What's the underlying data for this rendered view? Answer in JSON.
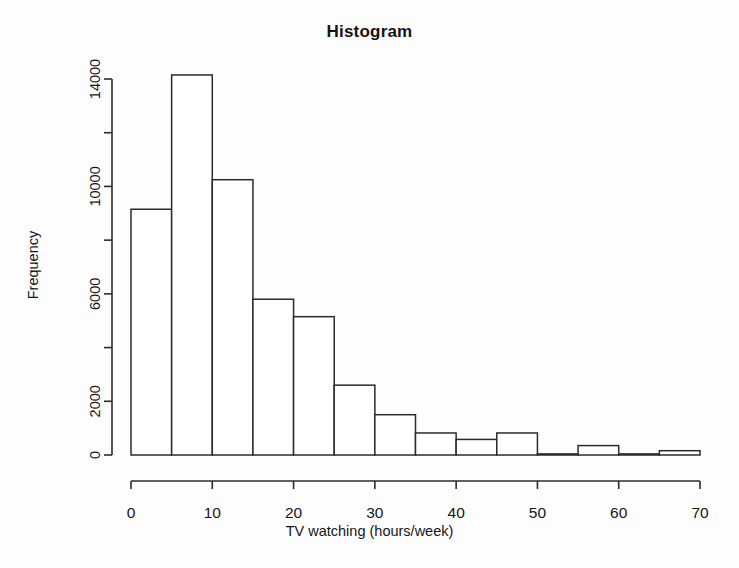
{
  "chart_data": {
    "type": "bar",
    "title": "Histogram",
    "xlabel": "TV watching (hours/week)",
    "ylabel": "Frequency",
    "xlim": [
      0,
      70
    ],
    "ylim": [
      0,
      14800
    ],
    "grid": false,
    "legend": "none",
    "bin_width": 5,
    "bin_edges": [
      0,
      5,
      10,
      15,
      20,
      25,
      30,
      35,
      40,
      45,
      50,
      55,
      60,
      65,
      70
    ],
    "categories": [
      "0-5",
      "5-10",
      "10-15",
      "15-20",
      "20-25",
      "25-30",
      "30-35",
      "35-40",
      "40-45",
      "45-50",
      "50-55",
      "55-60",
      "60-65",
      "65-70"
    ],
    "values": [
      9150,
      14150,
      10250,
      5800,
      5150,
      2600,
      1500,
      820,
      580,
      820,
      40,
      350,
      40,
      160
    ],
    "x_ticks": [
      0,
      10,
      20,
      30,
      40,
      50,
      60,
      70
    ],
    "x_tick_labels": [
      "0",
      "10",
      "20",
      "30",
      "40",
      "50",
      "60",
      "70"
    ],
    "y_ticks": [
      0,
      2000,
      4000,
      6000,
      8000,
      10000,
      12000,
      14000
    ],
    "y_tick_labels": [
      "0",
      "2000",
      "",
      "6000",
      "",
      "10000",
      "",
      "14000"
    ],
    "bar_fill": "#ffffff",
    "bar_stroke": "#2b2b2b",
    "background": "#fdfdfd"
  }
}
